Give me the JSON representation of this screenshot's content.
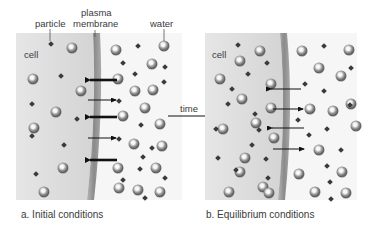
{
  "labels": {
    "particle": "particle",
    "plasma_membrane_line1": "plasma",
    "plasma_membrane_line2": "membrane",
    "water": "water",
    "cell_a": "cell",
    "cell_b": "cell",
    "time": "time"
  },
  "captions": {
    "panel_a": "a. Initial conditions",
    "panel_b": "b. Equilibrium conditions"
  },
  "panels": [
    {
      "id": "a",
      "title": "Initial conditions",
      "arrows": [
        {
          "direction": "left",
          "weight": "thick",
          "y": 80
        },
        {
          "direction": "right",
          "weight": "thin",
          "y": 100
        },
        {
          "direction": "left",
          "weight": "thick",
          "y": 117
        },
        {
          "direction": "right",
          "weight": "thin",
          "y": 138
        },
        {
          "direction": "left",
          "weight": "thick",
          "y": 160
        }
      ]
    },
    {
      "id": "b",
      "title": "Equilibrium conditions",
      "arrows": [
        {
          "direction": "left",
          "weight": "thin",
          "y": 89
        },
        {
          "direction": "right",
          "weight": "thin",
          "y": 109
        },
        {
          "direction": "left",
          "weight": "thin",
          "y": 128
        },
        {
          "direction": "right",
          "weight": "thin",
          "y": 149
        }
      ]
    }
  ],
  "colors": {
    "cell_fill": "#dcdcdc",
    "membrane": "#8e8e8e",
    "outside_fill": "#f7f7f7",
    "arrow": "#111111",
    "particle": "#3c3c3c",
    "water_sphere": "#9a9a9a"
  }
}
